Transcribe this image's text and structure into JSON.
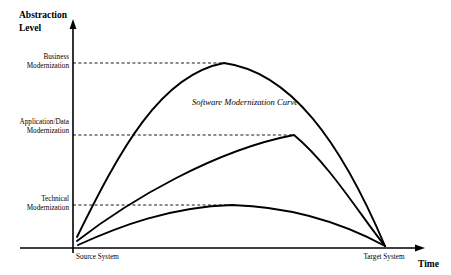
{
  "figure": {
    "background_color": "#ffffff",
    "stroke_color": "#000000",
    "caption_text": "Software Modernization Curve"
  },
  "axes": {
    "y_axis": {
      "title_line1": "Abstraction",
      "title_line2": "Level",
      "arrow": "up-arrow-icon"
    },
    "x_axis": {
      "title": "Time",
      "arrow": "right-arrow-icon"
    }
  },
  "y_levels": [
    {
      "id": "business",
      "label_line1": "Business",
      "label_line2": "Modernization",
      "guide_y": 63,
      "guide_x_end": 224
    },
    {
      "id": "application-data",
      "label_line1": "Application/Data",
      "label_line2": "Modernization",
      "guide_y": 135,
      "guide_x_end": 294
    },
    {
      "id": "technical",
      "label_line1": "Technical",
      "label_line2": "Modernization",
      "guide_y": 205,
      "guide_x_end": 232
    }
  ],
  "x_points": [
    {
      "id": "source-system",
      "label": "Source System"
    },
    {
      "id": "target-system",
      "label": "Target System"
    }
  ],
  "chart_data": {
    "type": "line",
    "title": "Software Modernization Curve",
    "xlabel": "Time",
    "ylabel": "Abstraction Level",
    "grid": false,
    "legend": "none",
    "x_tick_labels": [
      "Source System",
      "Target System"
    ],
    "y_tick_labels": [
      "Technical Modernization",
      "Application/Data Modernization",
      "Business Modernization"
    ],
    "series": [
      {
        "name": "Business Modernization",
        "peak_level": "Business Modernization",
        "start": "Source System",
        "end": "Target System",
        "path": "M 77,237 C 120,150 160,75 224,63 C 290,72 340,140 385,246"
      },
      {
        "name": "Application/Data Modernization",
        "peak_level": "Application/Data Modernization",
        "start": "Source System",
        "end": "Target System",
        "path": "M 77,241 C 130,200 215,150 294,135 C 330,165 360,215 385,246"
      },
      {
        "name": "Technical Modernization",
        "peak_level": "Technical Modernization",
        "start": "Source System",
        "end": "Target System",
        "path": "M 78,245 C 120,226 170,207 232,205 C 300,207 350,227 385,246"
      }
    ]
  }
}
